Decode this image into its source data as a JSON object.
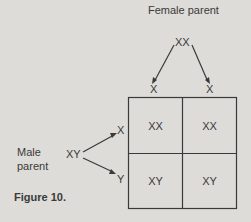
{
  "title": "Figure 10.",
  "female": {
    "label": "Female parent",
    "genotype": "XX",
    "gametes": [
      "X",
      "X"
    ]
  },
  "male": {
    "label_line1": "Male",
    "label_line2": "parent",
    "genotype": "XY",
    "gametes": [
      "X",
      "Y"
    ]
  },
  "grid": {
    "cells": [
      [
        "XX",
        "XX"
      ],
      [
        "XY",
        "XY"
      ]
    ]
  }
}
